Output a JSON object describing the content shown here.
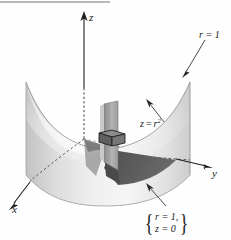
{
  "figure": {
    "axes": {
      "x_label": "x",
      "y_label": "y",
      "z_label": "z"
    },
    "labels": {
      "cylinder": "r = 1",
      "surface_lhs": "z",
      "surface_eq": "=",
      "surface_rhs": "r",
      "surface_exponent": "2",
      "base_region_line1": "r = 1,",
      "base_region_line2": "z = 0",
      "brace_left": "{",
      "brace_right": "}"
    },
    "colors": {
      "background": "#fefefe",
      "ink": "#1a1a1a",
      "surface_light": "#f2f2f2",
      "surface_mid": "#d9d9d9",
      "surface_dark": "#b0b0b0",
      "element_box": "#6e6e6e",
      "shadow_wedge": "#5a5a5a",
      "panel_gray": "#9a9a9a",
      "rule_gray": "#b9b9b9"
    }
  }
}
